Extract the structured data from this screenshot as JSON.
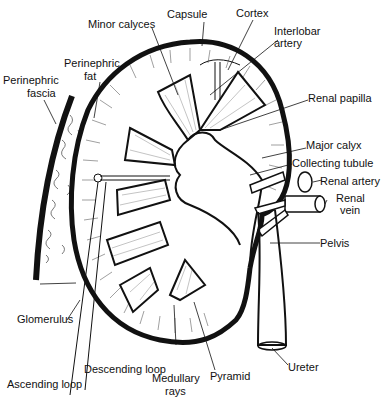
{
  "diagram": {
    "colors": {
      "ink": "#111111",
      "background": "#ffffff"
    },
    "labels": {
      "minor_calyces": "Minor calyces",
      "capsule": "Capsule",
      "cortex": "Cortex",
      "interlobar_artery_1": "Interlobar",
      "interlobar_artery_2": "artery",
      "perinephric_fat_1": "Perinephric",
      "perinephric_fat_2": "fat",
      "perinephric_fascia_1": "Perinephric",
      "perinephric_fascia_2": "fascia",
      "renal_papilla": "Renal papilla",
      "major_calyx": "Major calyx",
      "collecting_tubule": "Collecting tubule",
      "renal_artery": "Renal artery",
      "renal_vein_1": "Renal",
      "renal_vein_2": "vein",
      "pelvis": "Pelvis",
      "glomerulus": "Glomerulus",
      "descending_loop": "Descending loop",
      "ascending_loop": "Ascending loop",
      "medullary_rays_1": "Medullary",
      "medullary_rays_2": "rays",
      "pyramid": "Pyramid",
      "ureter": "Ureter"
    }
  }
}
